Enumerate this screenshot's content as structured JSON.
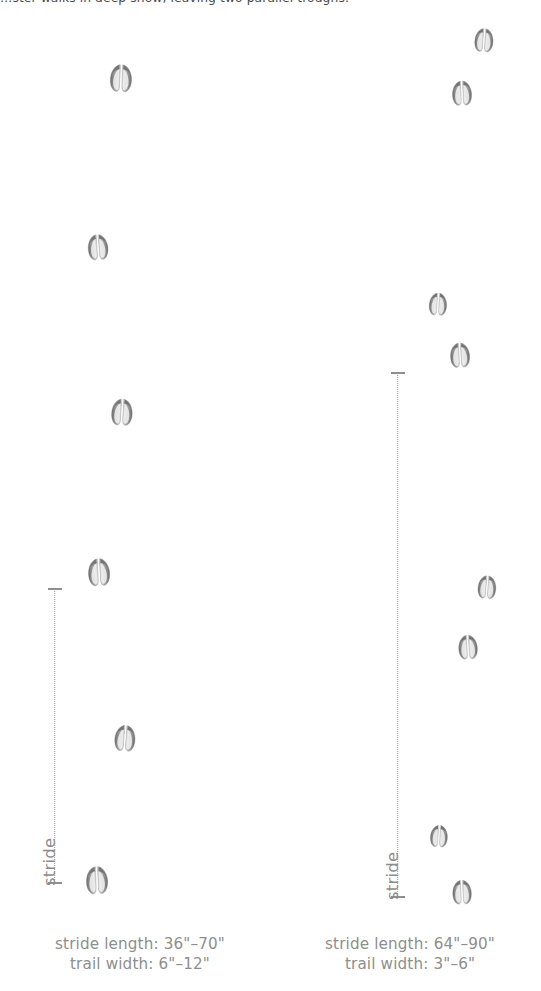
{
  "figure": {
    "top_caption": "…ster walks in deep snow, leaving two parallel troughs.",
    "icon_names": {
      "print": "hoof-print-icon",
      "measure_line": "stride-measurement-line-icon"
    }
  },
  "trails": [
    {
      "id": "left-trail",
      "name": "deer-trail-left",
      "measure": {
        "label": "stride",
        "x": 53,
        "y_top": 588,
        "y_bottom": 884
      },
      "caption": {
        "stride_length": "stride length: 36\"–70\"",
        "trail_width": "trail width: 6\"–12\"",
        "x": 10,
        "y": 934,
        "w": 260
      },
      "prints": [
        {
          "x": 121,
          "y": 78,
          "s": 1.0,
          "rot": 2
        },
        {
          "x": 97,
          "y": 246,
          "s": 0.93,
          "rot": -4
        },
        {
          "x": 122,
          "y": 412,
          "s": 0.97,
          "rot": 3
        },
        {
          "x": 99,
          "y": 572,
          "s": 1.0,
          "rot": -3
        },
        {
          "x": 124,
          "y": 737,
          "s": 0.95,
          "rot": 4
        },
        {
          "x": 97,
          "y": 880,
          "s": 1.0,
          "rot": -2
        }
      ]
    },
    {
      "id": "right-trail",
      "name": "deer-trail-right",
      "measure": {
        "label": "stride",
        "x": 396,
        "y_top": 372,
        "y_bottom": 898
      },
      "caption": {
        "stride_length": "stride length: 64\"–90\"",
        "trail_width": "trail width: 3\"–6\"",
        "x": 285,
        "y": 934,
        "w": 250
      },
      "prints": [
        {
          "x": 482,
          "y": 38,
          "s": 0.86,
          "rot": 4
        },
        {
          "x": 461,
          "y": 91,
          "s": 0.9,
          "rot": -2
        },
        {
          "x": 436,
          "y": 301,
          "s": 0.82,
          "rot": 3
        },
        {
          "x": 459,
          "y": 353,
          "s": 0.9,
          "rot": -3
        },
        {
          "x": 485,
          "y": 585,
          "s": 0.84,
          "rot": 4
        },
        {
          "x": 466,
          "y": 645,
          "s": 0.88,
          "rot": -3
        },
        {
          "x": 436,
          "y": 833,
          "s": 0.8,
          "rot": 3
        },
        {
          "x": 460,
          "y": 890,
          "s": 0.88,
          "rot": -2
        }
      ]
    }
  ],
  "colors": {
    "print_dark": "#6d6d6d",
    "print_mid": "#9f9f9f",
    "print_light": "#e2e2e2",
    "text_grey": "#8e8e8e",
    "text_dark": "#4a4a4a",
    "line_grey": "#9a9a9a",
    "background": "#ffffff"
  }
}
